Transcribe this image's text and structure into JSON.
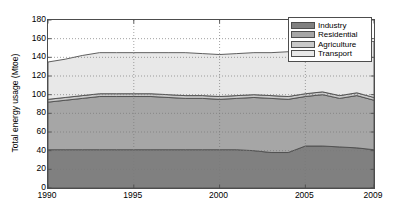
{
  "chart_data": {
    "type": "area",
    "title": "",
    "subtitle": "",
    "xlabel": "",
    "ylabel": "Total energy usage (Mtoe)",
    "stacked": true,
    "grid": true,
    "grid_style": "dotted",
    "legend_position": "top-right",
    "xlim": [
      1990,
      2009
    ],
    "ylim": [
      0,
      180
    ],
    "yticks": [
      0,
      20,
      40,
      60,
      80,
      100,
      120,
      140,
      160,
      180
    ],
    "xticks": [
      1990,
      1995,
      2000,
      2005,
      2009
    ],
    "x": [
      1990,
      1991,
      1992,
      1993,
      1994,
      1995,
      1996,
      1997,
      1998,
      1999,
      2000,
      2001,
      2002,
      2003,
      2004,
      2005,
      2006,
      2007,
      2008,
      2009
    ],
    "series": [
      {
        "name": "Industry",
        "color": "#808080",
        "values": [
          41,
          41,
          41,
          41,
          41,
          41,
          41,
          41,
          41,
          41,
          41,
          41,
          40,
          38,
          38,
          45,
          45,
          44,
          43,
          41
        ]
      },
      {
        "name": "Residential",
        "color": "#a6a6a6",
        "values": [
          51,
          53,
          55,
          57,
          57,
          57,
          57,
          56,
          55,
          55,
          54,
          55,
          57,
          58,
          57,
          53,
          55,
          52,
          56,
          53
        ]
      },
      {
        "name": "Agriculture",
        "color": "#c9c9c9",
        "values": [
          3,
          3,
          3,
          3,
          3,
          3,
          3,
          3,
          3,
          3,
          3,
          3,
          3,
          3,
          3,
          3,
          3,
          3,
          3,
          3
        ]
      },
      {
        "name": "Transport",
        "color": "#e8e8e8",
        "values": [
          40,
          41,
          43,
          44,
          44,
          44,
          44,
          45,
          46,
          45,
          45,
          45,
          45,
          46,
          48,
          54,
          55,
          57,
          56,
          60
        ]
      }
    ],
    "totals": [
      135,
      138,
      142,
      145,
      145,
      145,
      145,
      145,
      145,
      144,
      143,
      144,
      145,
      145,
      146,
      155,
      158,
      156,
      158,
      157
    ]
  },
  "legend": {
    "items": [
      {
        "label": "Industry",
        "color": "#808080"
      },
      {
        "label": "Residential",
        "color": "#a6a6a6"
      },
      {
        "label": "Agriculture",
        "color": "#c9c9c9"
      },
      {
        "label": "Transport",
        "color": "#e8e8e8"
      }
    ]
  }
}
